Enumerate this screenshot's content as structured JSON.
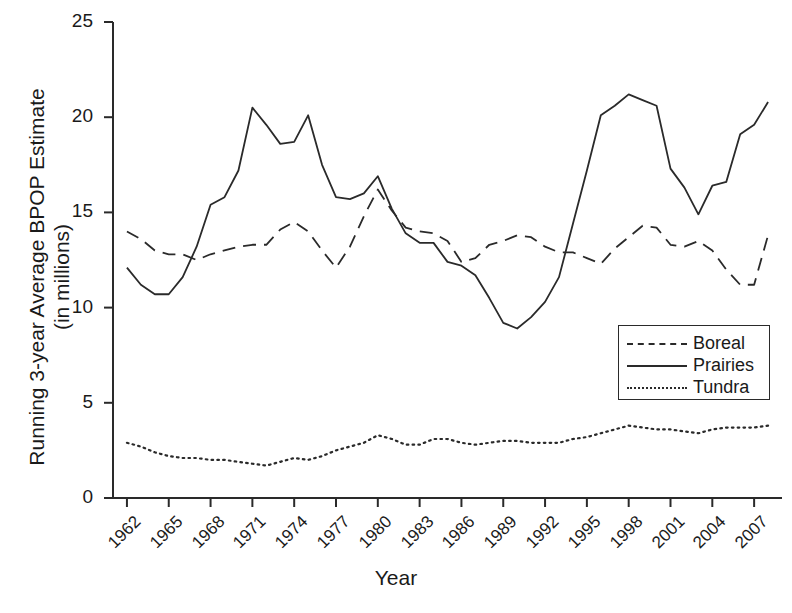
{
  "chart_data": {
    "type": "line",
    "title": "",
    "xlabel": "Year",
    "ylabel": "Running 3-year Average BPOP Estimate\n(in millions)",
    "ylabel_line1": "Running 3-year Average BPOP Estimate",
    "ylabel_line2": "(in millions)",
    "xlim": [
      1961,
      2009
    ],
    "ylim": [
      0,
      25
    ],
    "yticks": [
      0,
      5,
      10,
      15,
      20,
      25
    ],
    "ytick_labels": [
      "0",
      "5",
      "10",
      "15",
      "20",
      "25"
    ],
    "xticks": [
      1962,
      1965,
      1968,
      1971,
      1974,
      1977,
      1980,
      1983,
      1986,
      1989,
      1992,
      1995,
      1998,
      2001,
      2004,
      2007
    ],
    "xtick_labels": [
      "1962",
      "1965",
      "1968",
      "1971",
      "1974",
      "1977",
      "1980",
      "1983",
      "1986",
      "1989",
      "1992",
      "1995",
      "1998",
      "2001",
      "2004",
      "2007"
    ],
    "xtick_rotation": -45,
    "grid": false,
    "legend_position": "center-right",
    "line_color": "#2a2a2a",
    "x": [
      1962,
      1963,
      1964,
      1965,
      1966,
      1967,
      1968,
      1969,
      1970,
      1971,
      1972,
      1973,
      1974,
      1975,
      1976,
      1977,
      1978,
      1979,
      1980,
      1981,
      1982,
      1983,
      1984,
      1985,
      1986,
      1987,
      1988,
      1989,
      1990,
      1991,
      1992,
      1993,
      1994,
      1995,
      1996,
      1997,
      1998,
      1999,
      2000,
      2001,
      2002,
      2003,
      2004,
      2005,
      2006,
      2007,
      2008
    ],
    "series": [
      {
        "name": "Boreal",
        "style": "dashed",
        "values": [
          14.0,
          13.6,
          13.0,
          12.8,
          12.8,
          12.5,
          12.8,
          13.0,
          13.2,
          13.3,
          13.3,
          14.1,
          14.5,
          14.0,
          13.0,
          12.1,
          13.2,
          14.8,
          16.2,
          15.1,
          14.2,
          14.0,
          13.9,
          13.5,
          12.4,
          12.6,
          13.3,
          13.5,
          13.8,
          13.7,
          13.2,
          12.9,
          12.9,
          12.6,
          12.3,
          13.1,
          13.7,
          14.3,
          14.2,
          13.3,
          13.2,
          13.5,
          13.0,
          12.0,
          11.2,
          11.2,
          13.8
        ]
      },
      {
        "name": "Prairies",
        "style": "solid",
        "values": [
          12.1,
          11.2,
          10.7,
          10.7,
          11.6,
          13.2,
          15.4,
          15.8,
          17.2,
          20.5,
          19.6,
          18.6,
          18.7,
          20.1,
          17.5,
          15.8,
          15.7,
          16.0,
          16.9,
          15.2,
          13.9,
          13.4,
          13.4,
          12.4,
          12.2,
          11.7,
          10.5,
          9.2,
          8.9,
          9.5,
          10.3,
          11.6,
          14.4,
          17.2,
          20.1,
          20.6,
          21.2,
          20.9,
          20.6,
          17.3,
          16.3,
          14.9,
          16.4,
          16.6,
          19.1,
          19.6,
          20.8
        ]
      },
      {
        "name": "Tundra",
        "style": "dotted",
        "values": [
          2.9,
          2.7,
          2.4,
          2.2,
          2.1,
          2.1,
          2.0,
          2.0,
          1.9,
          1.8,
          1.7,
          1.9,
          2.1,
          2.0,
          2.2,
          2.5,
          2.7,
          2.9,
          3.3,
          3.1,
          2.8,
          2.8,
          3.1,
          3.1,
          2.9,
          2.8,
          2.9,
          3.0,
          3.0,
          2.9,
          2.9,
          2.9,
          3.1,
          3.2,
          3.4,
          3.6,
          3.8,
          3.7,
          3.6,
          3.6,
          3.5,
          3.4,
          3.6,
          3.7,
          3.7,
          3.7,
          3.8
        ]
      }
    ]
  },
  "legend": {
    "items": [
      {
        "label": "Boreal",
        "style": "dashed"
      },
      {
        "label": "Prairies",
        "style": "solid"
      },
      {
        "label": "Tundra",
        "style": "dotted"
      }
    ]
  }
}
